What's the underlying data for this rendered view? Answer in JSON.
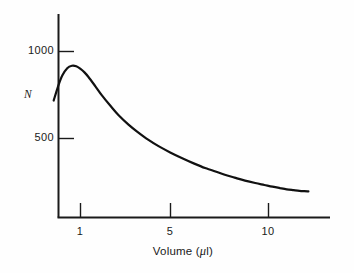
{
  "figure": {
    "background_color": "#fefefe",
    "ink_color": "#1a1a1a"
  },
  "axes": {
    "y_title": "N",
    "x_title_prefix": "Volume (",
    "x_title_mu": "μ",
    "x_title_suffix": "l)",
    "y_tick_labels": [
      "1000",
      "500"
    ],
    "x_tick_labels": [
      "1",
      "5",
      "10"
    ]
  },
  "chart_data": {
    "type": "line",
    "title": "",
    "subtitle": "",
    "xlabel": "Volume (μl)",
    "ylabel": "N",
    "xscale": "log",
    "yscale": "linear",
    "grid": false,
    "legend": false,
    "xlim": [
      0.72,
      16.5
    ],
    "ylim": [
      0,
      1215
    ],
    "xticks": [
      1,
      5,
      10
    ],
    "xticklabels": [
      "1",
      "5",
      "10"
    ],
    "yticks": [
      500,
      1000
    ],
    "yticklabels": [
      "500",
      "1000"
    ],
    "line_color": "#111111",
    "line_width": 2.2,
    "series": [
      {
        "name": "N",
        "x": [
          0.72,
          0.76,
          0.8,
          0.85,
          0.9,
          0.95,
          1.0,
          1.05,
          1.1,
          1.2,
          1.3,
          1.45,
          1.6,
          1.8,
          2.0,
          2.3,
          2.6,
          3.0,
          3.5,
          4.0,
          4.6,
          5.0,
          5.8,
          6.6,
          7.5,
          8.5,
          9.5,
          10.5,
          11.5,
          12.5,
          13.6,
          14.6,
          15.5,
          16.3
        ],
        "y": [
          718,
          800,
          862,
          904,
          918,
          915,
          900,
          880,
          855,
          800,
          748,
          685,
          632,
          580,
          540,
          492,
          456,
          420,
          385,
          357,
          330,
          318,
          293,
          275,
          258,
          244,
          233,
          223,
          215,
          208,
          203,
          199,
          197,
          196
        ]
      }
    ],
    "annotations": []
  }
}
